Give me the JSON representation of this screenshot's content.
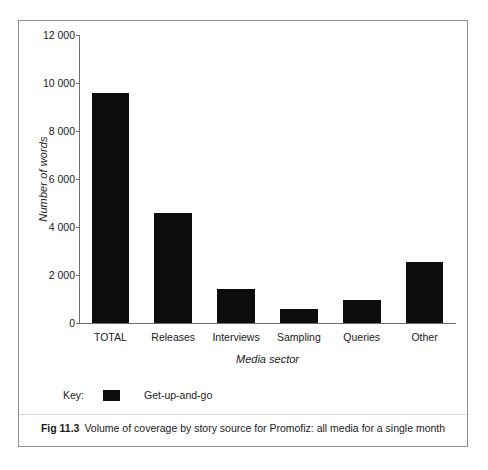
{
  "figure": {
    "caption_number": "Fig 11.3",
    "caption_text": "Volume of coverage by story source for Promofiz: all media for a single month"
  },
  "legend": {
    "key_label": "Key:",
    "series_label": "Get-up-and-go",
    "swatch_color": "#0d0d0d"
  },
  "chart_data": {
    "type": "bar",
    "title": "",
    "subtitle": "",
    "xlabel": "Media sector",
    "ylabel": "Number of words",
    "categories": [
      "TOTAL",
      "Releases",
      "Interviews",
      "Sampling",
      "Queries",
      "Other"
    ],
    "values": [
      9600,
      4600,
      1400,
      600,
      950,
      2550
    ],
    "series": [
      {
        "name": "Get-up-and-go",
        "color": "#0d0d0d",
        "values": [
          9600,
          4600,
          1400,
          600,
          950,
          2550
        ]
      }
    ],
    "ylim": [
      0,
      12000
    ],
    "ytick_values": [
      0,
      2000,
      4000,
      6000,
      8000,
      10000,
      12000
    ],
    "ytick_labels": [
      "0",
      "2 000",
      "4 000",
      "6 000",
      "8 000",
      "10 000",
      "12 000"
    ],
    "grid": false,
    "legend_position": "below-left",
    "bar_color": "#0d0d0d"
  }
}
